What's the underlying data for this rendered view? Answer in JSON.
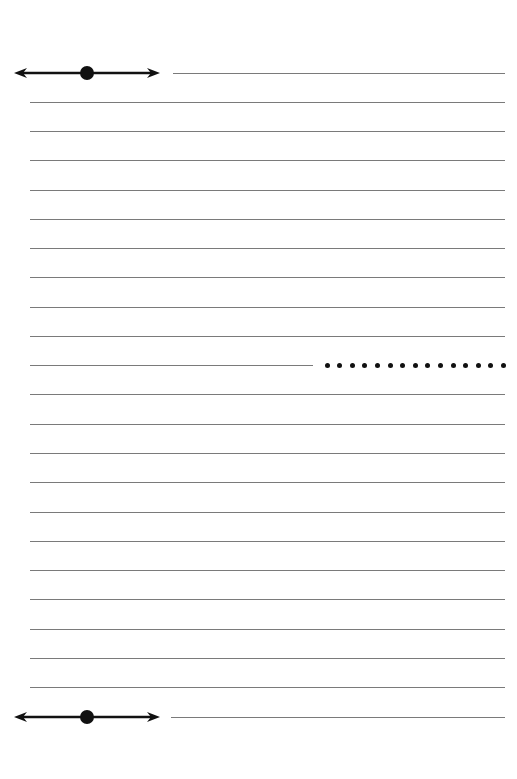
{
  "page": {
    "type": "lined-paper",
    "background": "#ffffff",
    "line_color": "#7a7a7a",
    "marker_color": "#111111"
  },
  "top_marker": {
    "y": 73,
    "x1": 14,
    "x2": 160,
    "dot_x": 87,
    "line_x1": 173,
    "line_x2": 505
  },
  "bottom_marker": {
    "y": 717,
    "x1": 14,
    "x2": 160,
    "dot_x": 87,
    "line_x1": 171,
    "line_x2": 505
  },
  "ruled_lines": {
    "x1": 30,
    "x2": 505,
    "y_positions": [
      102,
      131,
      160,
      190,
      219,
      248,
      277,
      307,
      336,
      394,
      424,
      453,
      482,
      512,
      541,
      570,
      599,
      629,
      658,
      687
    ]
  },
  "middle_line": {
    "y": 365,
    "x1": 30,
    "x2": 313
  },
  "dotted_line": {
    "y": 365,
    "x_start": 327,
    "count": 15,
    "spacing": 12.6
  }
}
